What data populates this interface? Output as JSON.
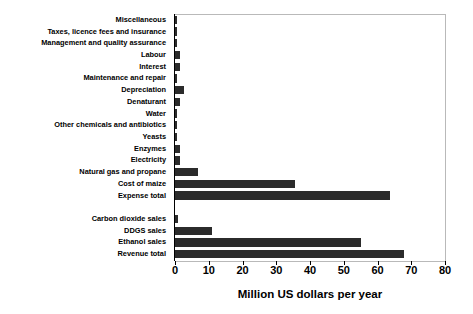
{
  "chart_data": {
    "type": "bar",
    "orientation": "horizontal",
    "title": "",
    "xlabel": "Million US dollars per year",
    "ylabel": "",
    "xlim": [
      0,
      80
    ],
    "xticks": [
      0,
      10,
      20,
      30,
      40,
      50,
      60,
      70,
      80
    ],
    "xtick_labels": [
      "0",
      "10",
      "20",
      "30",
      "40",
      "50",
      "60",
      "70",
      "80"
    ],
    "grid": false,
    "legend": false,
    "bar_color": "#2b2b2b",
    "categories": [
      "Miscellaneous",
      "Taxes, licence fees and  insurance",
      "Management and quality assurance",
      "Labour",
      "Interest",
      "Maintenance and repair",
      "Depreciation",
      "Denaturant",
      "Water",
      "Other chemicals and antibiotics",
      "Yeasts",
      "Enzymes",
      "Electricity",
      "Natural gas and propane",
      "Cost of maize",
      "Expense total",
      "",
      "Carbon dioxide sales",
      "DDGS sales",
      "Ethanol sales",
      "Revenue total"
    ],
    "values": [
      0.5,
      0.3,
      0.4,
      1.5,
      1.6,
      0.5,
      2.7,
      1.4,
      0.2,
      0.6,
      0.6,
      1.4,
      1.4,
      6.7,
      35.7,
      63.7,
      null,
      0.9,
      11.0,
      55.0,
      67.8
    ],
    "group_gap_after_index": 15
  }
}
